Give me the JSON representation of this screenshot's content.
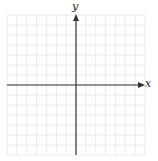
{
  "graph": {
    "x_axis_label": "x",
    "y_axis_label": "y",
    "grid": {
      "columns": 14,
      "rows": 14,
      "x_min": -7,
      "x_max": 7,
      "y_min": -7,
      "y_max": 7
    },
    "colors": {
      "grid": "#e4e4e4",
      "axis": "#333333",
      "background": "#ffffff"
    }
  }
}
